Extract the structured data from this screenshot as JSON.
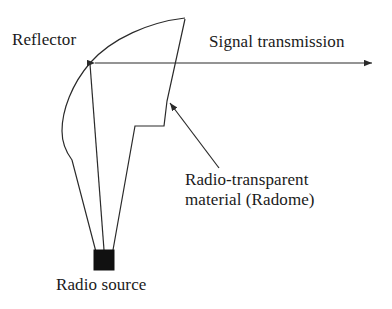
{
  "diagram": {
    "background_color": "#ffffff",
    "stroke_color": "#2a2a2a",
    "source_fill_color": "#111111",
    "labels": {
      "reflector": "Reflector",
      "signal_transmission": "Signal transmission",
      "radome_line1": "Radio-transparent",
      "radome_line2": "material (Radome)",
      "radio_source": "Radio source"
    },
    "parts": [
      {
        "name": "reflector-dish",
        "label": "Reflector",
        "description": "Curved parabolic dish arc from top right down to radio source"
      },
      {
        "name": "radome-cover",
        "label": "Radio-transparent material (Radome)",
        "description": "Stepped enclosure line from dish top edge down to radio source"
      },
      {
        "name": "radio-source",
        "label": "Radio source",
        "description": "Filled black square feed at the dish focus"
      },
      {
        "name": "signal-beam",
        "label": "Signal transmission",
        "description": "Horizontal double arrow indicating outgoing beam direction"
      }
    ]
  }
}
